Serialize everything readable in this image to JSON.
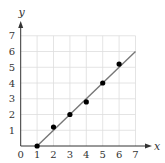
{
  "chart_data": {
    "type": "scatter",
    "title": "",
    "xlabel": "x",
    "ylabel": "y",
    "xlim": [
      0,
      7
    ],
    "ylim": [
      0,
      7
    ],
    "grid": true,
    "x_ticks": [
      "0",
      "1",
      "2",
      "3",
      "4",
      "5",
      "6",
      "7"
    ],
    "y_ticks": [
      "1",
      "2",
      "3",
      "4",
      "5",
      "6",
      "7"
    ],
    "series": [
      {
        "name": "data points",
        "type": "scatter",
        "points": [
          [
            1,
            0
          ],
          [
            2,
            1.2
          ],
          [
            3,
            2
          ],
          [
            4,
            2.8
          ],
          [
            5,
            4
          ],
          [
            6,
            5.2
          ]
        ]
      },
      {
        "name": "fit line",
        "type": "line",
        "points": [
          [
            1,
            0
          ],
          [
            7,
            6
          ]
        ]
      }
    ],
    "colors": {
      "points": "#000000",
      "line": "#777777",
      "grid": "#dddddd",
      "axis": "#333333"
    }
  }
}
